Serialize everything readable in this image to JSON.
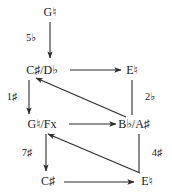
{
  "diagram": {
    "type": "directed-graph",
    "nodes": [
      {
        "id": "g-natural",
        "label": "G♮",
        "x": 50,
        "y": 12
      },
      {
        "id": "cs-db",
        "label": "C♯/D♭",
        "x": 42,
        "y": 70
      },
      {
        "id": "e-natural",
        "label": "E♮",
        "x": 132,
        "y": 70
      },
      {
        "id": "gn-fx",
        "label": "G♮/Fx",
        "x": 42,
        "y": 124
      },
      {
        "id": "bb-as",
        "label": "B♭/A♯",
        "x": 134,
        "y": 124
      },
      {
        "id": "cs",
        "label": "C♯",
        "x": 48,
        "y": 181
      },
      {
        "id": "e-natural-2",
        "label": "E♮",
        "x": 147,
        "y": 181
      }
    ],
    "edges": [
      {
        "id": "e1",
        "from": "g-natural",
        "to": "cs-db",
        "label": "5♭",
        "label_x": 31,
        "label_y": 38
      },
      {
        "id": "e2",
        "from": "cs-db",
        "to": "e-natural",
        "label": "",
        "label_x": 0,
        "label_y": 0
      },
      {
        "id": "e3",
        "from": "cs-db",
        "to": "gn-fx",
        "label": "1♯",
        "label_x": 12,
        "label_y": 97
      },
      {
        "id": "e4",
        "from": "e-natural",
        "to": "bb-as",
        "label": "2♭",
        "label_x": 150,
        "label_y": 97
      },
      {
        "id": "e5",
        "from": "gn-fx",
        "to": "bb-as",
        "label": "",
        "label_x": 0,
        "label_y": 0
      },
      {
        "id": "e6",
        "from": "bb-as",
        "to": "cs-db",
        "label": "",
        "label_x": 0,
        "label_y": 0
      },
      {
        "id": "e7",
        "from": "gn-fx",
        "to": "cs",
        "label": "7♯",
        "label_x": 27,
        "label_y": 153
      },
      {
        "id": "e8",
        "from": "bb-as",
        "to": "e-natural-2",
        "label": "4♯",
        "label_x": 157,
        "label_y": 153
      },
      {
        "id": "e9",
        "from": "cs",
        "to": "e-natural-2",
        "label": "",
        "label_x": 0,
        "label_y": 0
      },
      {
        "id": "e10",
        "from": "e-natural-2",
        "to": "gn-fx",
        "label": "",
        "label_x": 0,
        "label_y": 0
      }
    ],
    "colors": {
      "line": "#2b2b2b",
      "text": "#1a1a1a",
      "background": "#ffffff"
    }
  }
}
